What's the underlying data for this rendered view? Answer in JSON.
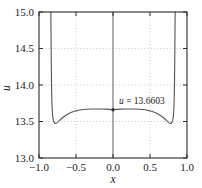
{
  "chart_data": {
    "type": "line",
    "title": "",
    "xlabel": "x",
    "ylabel": "u",
    "xlim": [
      -1.0,
      1.0
    ],
    "ylim": [
      13.0,
      15.0
    ],
    "grid": true,
    "grid_style": "dotted",
    "legend": null,
    "x_ticks": [
      -1.0,
      -0.5,
      0.0,
      0.5,
      1.0
    ],
    "x_tick_labels": [
      "-1.0",
      "-0.5",
      "0.0",
      "0.5",
      "1.0"
    ],
    "y_ticks": [
      13.0,
      13.5,
      14.0,
      14.5,
      15.0
    ],
    "y_tick_labels": [
      "13.0",
      "13.5",
      "14.0",
      "14.5",
      "15.0"
    ],
    "annotations": [
      {
        "name": "center-value-annotation",
        "text_italic": "u",
        "text_rest": " = 13.6603",
        "full_text": "u = 13.6603",
        "x": 0.0,
        "y": 13.6603,
        "marker": "dot"
      }
    ],
    "series": [
      {
        "name": "u(x)",
        "color": "#555555",
        "x": [
          -0.84,
          -0.838,
          -0.836,
          -0.833,
          -0.83,
          -0.826,
          -0.822,
          -0.817,
          -0.812,
          -0.806,
          -0.8,
          -0.793,
          -0.786,
          -0.778,
          -0.77,
          -0.76,
          -0.75,
          -0.73,
          -0.71,
          -0.69,
          -0.67,
          -0.65,
          -0.62,
          -0.59,
          -0.56,
          -0.53,
          -0.5,
          -0.45,
          -0.4,
          -0.35,
          -0.3,
          -0.25,
          -0.2,
          -0.15,
          -0.1,
          -0.05,
          0.0,
          0.05,
          0.1,
          0.15,
          0.2,
          0.25,
          0.3,
          0.35,
          0.4,
          0.45,
          0.5,
          0.53,
          0.56,
          0.59,
          0.62,
          0.65,
          0.67,
          0.69,
          0.71,
          0.73,
          0.75,
          0.76,
          0.77,
          0.778,
          0.786,
          0.793,
          0.8,
          0.806,
          0.812,
          0.817,
          0.822,
          0.826,
          0.83,
          0.833,
          0.836,
          0.838,
          0.84
        ],
        "y": [
          15.0,
          14.75,
          14.5,
          14.2,
          13.95,
          13.78,
          13.67,
          13.59,
          13.545,
          13.515,
          13.495,
          13.483,
          13.476,
          13.473,
          13.474,
          13.48,
          13.489,
          13.508,
          13.527,
          13.545,
          13.561,
          13.576,
          13.595,
          13.612,
          13.626,
          13.637,
          13.646,
          13.657,
          13.6645,
          13.6685,
          13.6705,
          13.671,
          13.671,
          13.6705,
          13.6695,
          13.6655,
          13.6603,
          13.6655,
          13.6695,
          13.6705,
          13.671,
          13.671,
          13.6705,
          13.6685,
          13.6645,
          13.657,
          13.646,
          13.637,
          13.626,
          13.612,
          13.595,
          13.576,
          13.561,
          13.545,
          13.527,
          13.508,
          13.489,
          13.48,
          13.474,
          13.473,
          13.476,
          13.483,
          13.495,
          13.515,
          13.545,
          13.59,
          13.67,
          13.78,
          13.95,
          14.2,
          14.5,
          14.75,
          15.0
        ]
      }
    ],
    "colors": {
      "curve": "#555555",
      "axis": "#2b2b2b",
      "grid": "#bdbdbd",
      "center_axis": "#4a4a4a",
      "background": "#ffffff",
      "text": "#1a1a1a"
    }
  }
}
